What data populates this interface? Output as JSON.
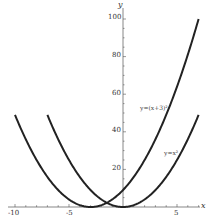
{
  "chart_data": {
    "type": "line",
    "title": "",
    "xlabel": "x",
    "ylabel": "y",
    "xlim": [
      -10,
      7
    ],
    "ylim": [
      0,
      100
    ],
    "grid": false,
    "x_ticks": [
      -10,
      -5,
      5
    ],
    "x_tick_labels": [
      "-10",
      "-5",
      "5"
    ],
    "y_ticks": [
      20,
      40,
      60,
      80,
      100
    ],
    "y_tick_labels": [
      "20",
      "40",
      "60",
      "80",
      "100"
    ],
    "series": [
      {
        "name": "y=x²",
        "label": "y=x²",
        "formula": "x^2",
        "x": [
          -7,
          -6,
          -5,
          -4,
          -3,
          -2,
          -1,
          0,
          1,
          2,
          3,
          4,
          5,
          6,
          7
        ],
        "values": [
          49,
          36,
          25,
          16,
          9,
          4,
          1,
          0,
          1,
          4,
          9,
          16,
          25,
          36,
          49
        ]
      },
      {
        "name": "y=(x+3)²",
        "label": "y=(x+3)²",
        "formula": "(x+3)^2",
        "x": [
          -10,
          -9,
          -8,
          -7,
          -6,
          -5,
          -4,
          -3,
          -2,
          -1,
          0,
          1,
          2,
          3,
          4,
          5,
          6,
          7
        ],
        "values": [
          49,
          36,
          25,
          16,
          9,
          4,
          1,
          0,
          1,
          4,
          9,
          16,
          25,
          36,
          49,
          64,
          81,
          100
        ]
      }
    ]
  },
  "labels": {
    "x_axis": "x",
    "y_axis": "y",
    "series1": "y=(x+3)²",
    "series2": "y=x²",
    "tick_x_m10": "-10",
    "tick_x_m5": "-5",
    "tick_x_5": "5",
    "tick_y_20": "20",
    "tick_y_40": "40",
    "tick_y_60": "60",
    "tick_y_80": "80",
    "tick_y_100": "100"
  }
}
